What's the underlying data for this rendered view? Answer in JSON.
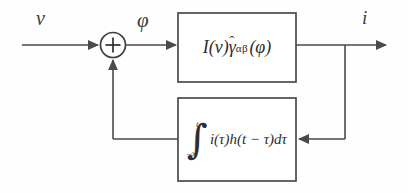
{
  "diagram": {
    "stroke_color": "#4a4a4a",
    "text_color": "#2e2e2e",
    "background_color": "#fefefe",
    "labels": {
      "input": "v",
      "error": "φ",
      "output": "i"
    },
    "summing_junction": {
      "name": "summing-junction",
      "sign": "+"
    },
    "forward_block": {
      "name": "forward-transfer-block",
      "expression_parts": {
        "gain": "I(v)",
        "kernel_base": "γ",
        "kernel_hat": "ˆ",
        "kernel_subscript": "αβ",
        "argument": "(φ)"
      },
      "expression_plain": "I(v)γ̂αβ(φ)"
    },
    "feedback_block": {
      "name": "feedback-convolution-block",
      "expression_parts": {
        "integral_sign": "∫",
        "upper_limit": "t",
        "lower_limit": "−∞",
        "integrand": "i(τ)h(t − τ)dτ"
      },
      "expression_plain": "∫_{−∞}^{t} i(τ)h(t−τ)dτ"
    }
  }
}
